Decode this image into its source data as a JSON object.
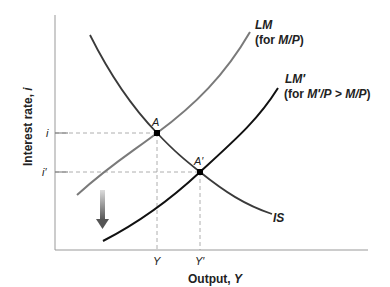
{
  "diagram": {
    "type": "IS-LM",
    "axes": {
      "xlabel": "Output, ",
      "xlabel_var": "Y",
      "ylabel": "Interest rate, ",
      "ylabel_var": "i",
      "x_ticks": [
        "Y",
        "Y′"
      ],
      "y_ticks": [
        "i",
        "i′"
      ]
    },
    "curves": {
      "lm": {
        "label": "LM",
        "sublabel_prefix": "(for ",
        "sublabel_var": "M/P",
        "sublabel_suffix": ")",
        "color": "#7a7a7a"
      },
      "lm_prime": {
        "label": "LM′",
        "sublabel_prefix": "(for ",
        "sublabel_var": "M′/P",
        "sublabel_mid": " > ",
        "sublabel_var2": "M/P",
        "sublabel_suffix": ")",
        "color": "#111111"
      },
      "is": {
        "label": "IS",
        "color": "#3a3a3a"
      }
    },
    "points": {
      "a": {
        "label": "A"
      },
      "a_prime": {
        "label": "A′"
      }
    },
    "shift_arrow": {
      "direction": "down",
      "color": "#666666"
    }
  }
}
